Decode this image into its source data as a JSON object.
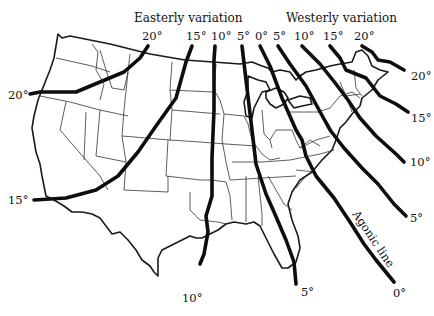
{
  "headings": {
    "easterly": "Easterly variation",
    "westerly": "Westerly variation"
  },
  "isogonic_lines": [
    {
      "id": "e20",
      "direction": "east",
      "label_top": "20°",
      "label_end": "20°"
    },
    {
      "id": "e15",
      "direction": "east",
      "label_top": "15°",
      "label_end": "15°"
    },
    {
      "id": "e10",
      "direction": "east",
      "label_top": "10°",
      "label_end": "10°"
    },
    {
      "id": "e5",
      "direction": "east",
      "label_top": "5°",
      "label_end": "5°"
    },
    {
      "id": "a0",
      "direction": "none",
      "label_top": "0°",
      "label_end": "0°",
      "name": "Agonic line"
    },
    {
      "id": "w5",
      "direction": "west",
      "label_top": "5°",
      "label_end": "5°"
    },
    {
      "id": "w10",
      "direction": "west",
      "label_top": "10°",
      "label_end": "10°"
    },
    {
      "id": "w15",
      "direction": "west",
      "label_top": "15°",
      "label_end": "15°"
    },
    {
      "id": "w20",
      "direction": "west",
      "label_top": "20°",
      "label_end": "20°"
    }
  ],
  "agonic_label": "Agonic line"
}
